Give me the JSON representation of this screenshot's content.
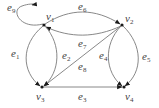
{
  "diagram": {
    "type": "directed-graph",
    "colors": {
      "edge": "#7a7a7a",
      "node": "#1a1a1a",
      "label": "#444444",
      "background": "#ffffff"
    },
    "vertices": [
      {
        "id": "v1",
        "letter": "v",
        "index": "1",
        "x": 44,
        "y": 25
      },
      {
        "id": "v2",
        "letter": "v",
        "index": "2",
        "x": 122,
        "y": 25
      },
      {
        "id": "v3",
        "letter": "v",
        "index": "3",
        "x": 42,
        "y": 87
      },
      {
        "id": "v4",
        "letter": "v",
        "index": "4",
        "x": 124,
        "y": 87
      }
    ],
    "edges": [
      {
        "id": "e1",
        "letter": "e",
        "index": "1",
        "from": "v1",
        "to": "v3"
      },
      {
        "id": "e2",
        "letter": "e",
        "index": "2",
        "from": "v1",
        "to": "v3"
      },
      {
        "id": "e3",
        "letter": "e",
        "index": "3",
        "from": "v3",
        "to": "v4"
      },
      {
        "id": "e4",
        "letter": "e",
        "index": "4",
        "from": "v2",
        "to": "v4"
      },
      {
        "id": "e5",
        "letter": "e",
        "index": "5",
        "from": "v2",
        "to": "v4"
      },
      {
        "id": "e6",
        "letter": "e",
        "index": "6",
        "from": "v1",
        "to": "v2"
      },
      {
        "id": "e7",
        "letter": "e",
        "index": "7",
        "from": "v2",
        "to": "v1"
      },
      {
        "id": "e8",
        "letter": "e",
        "index": "8",
        "from": "v2",
        "to": "v3"
      },
      {
        "id": "e9",
        "letter": "e",
        "index": "9",
        "from": "v1",
        "to": "v1"
      }
    ]
  }
}
